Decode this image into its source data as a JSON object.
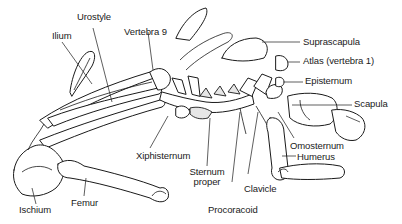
{
  "diagram": {
    "labels": {
      "urostyle": "Urostyle",
      "ilium": "Ilium",
      "vertebra9": "Vertebra 9",
      "suprascapula": "Suprascapula",
      "atlas": "Atlas (vertebra 1)",
      "episternum": "Episternum",
      "scapula": "Scapula",
      "omosternum": "Omosternum",
      "humerus": "Humerus",
      "xiphisternum": "Xiphisternum",
      "sternum_line1": "Sternum",
      "sternum_line2": "proper",
      "clavicle": "Clavicle",
      "procoracoid": "Procoracoid",
      "ischium": "Ischium",
      "femur": "Femur"
    },
    "colors": {
      "stroke": "#1a1a1a",
      "background": "#ffffff",
      "shade": "#e6e6e6"
    }
  }
}
